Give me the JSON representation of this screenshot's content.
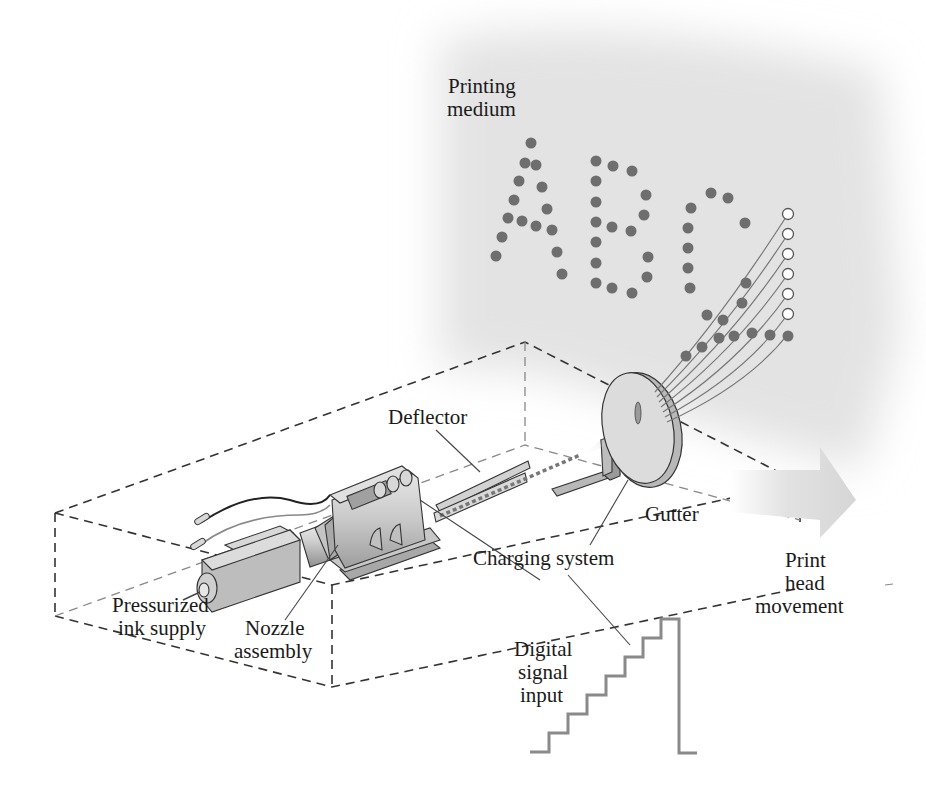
{
  "diagram": {
    "labels": {
      "printing_medium": [
        "Printing",
        "medium"
      ],
      "deflector": "Deflector",
      "gutter": "Gutter",
      "charging_system": "Charging system",
      "pressurized_ink_supply": [
        "Pressurized",
        "ink supply"
      ],
      "nozzle_assembly": [
        "Nozzle",
        "assembly"
      ],
      "digital_signal_input": [
        "Digital",
        "signal",
        "input"
      ],
      "print_head_movement": [
        "Print",
        "head",
        "movement"
      ]
    },
    "printed_text": "ABC",
    "colors": {
      "ink_drop": "#6e6e6e",
      "medium_background": "#e4e4e4",
      "arrow": "#d9d9d9",
      "device": "#c8c8c8"
    },
    "drop_column": {
      "filled_dots": 1,
      "empty_dots": 6
    },
    "signal_steps": 7
  }
}
